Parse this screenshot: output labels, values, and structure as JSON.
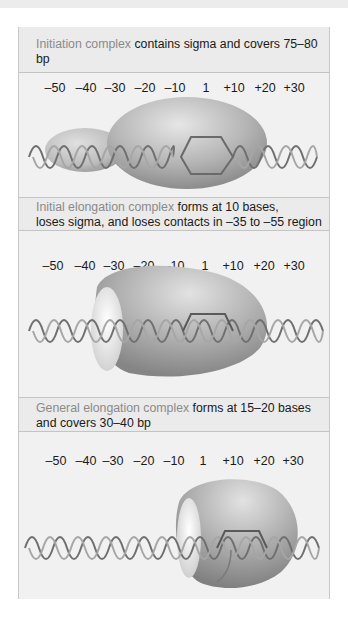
{
  "figure": {
    "panels": [
      {
        "term": "Initiation complex",
        "description": " contains sigma and covers 75–80 bp",
        "description_line2": ""
      },
      {
        "term": "Initial elongation complex",
        "description": " forms at 10 bases,",
        "description_line2": "loses sigma, and loses contacts in –35 to –55 region"
      },
      {
        "term": "General elongation complex",
        "description": " forms at 15–20 bases",
        "description_line2": "and covers 30–40 bp"
      }
    ],
    "positions": [
      "–50",
      "–40",
      "–30",
      "–20",
      "–10",
      "1",
      "+10",
      "+20",
      "+30"
    ]
  },
  "colors": {
    "panel_bg": "#f1f1f1",
    "header_bg": "#ebebeb",
    "term_text": "#8a8a8a",
    "body_text": "#1a1a1a",
    "border": "#c4c4c4"
  }
}
